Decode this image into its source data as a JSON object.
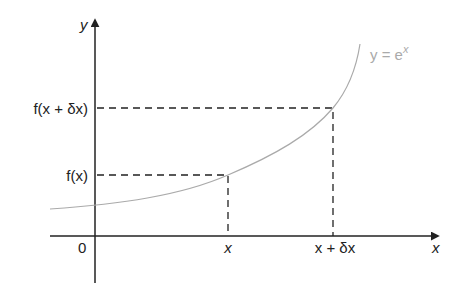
{
  "diagram": {
    "axes": {
      "x_label": "x",
      "y_label": "y",
      "origin_label": "0"
    },
    "curve": {
      "label_lhs": "y = e",
      "label_exp": "x",
      "color": "#aaaaaa"
    },
    "points": [
      {
        "x_tick": "x",
        "y_tick": "f(x)"
      },
      {
        "x_tick": "x + δx",
        "y_tick": "f(x + δx)"
      }
    ],
    "colors": {
      "axes": "#222222",
      "dashed": "#222222",
      "curve": "#aaaaaa"
    }
  }
}
